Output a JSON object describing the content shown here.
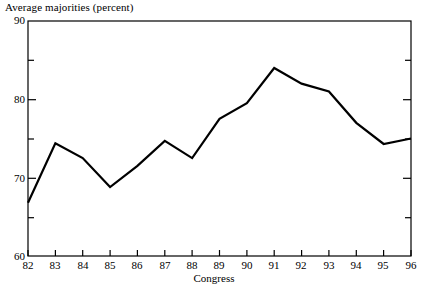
{
  "chart_data": {
    "type": "line",
    "title": "Average majorities (percent)",
    "xlabel": "Congress",
    "ylabel": "",
    "categories": [
      "82",
      "83",
      "84",
      "85",
      "86",
      "87",
      "88",
      "89",
      "90",
      "91",
      "92",
      "93",
      "94",
      "95",
      "96"
    ],
    "values": [
      66.8,
      74.4,
      72.5,
      68.8,
      71.5,
      74.7,
      72.5,
      77.5,
      79.5,
      84.0,
      82.0,
      81.0,
      77.0,
      74.3,
      75.0
    ],
    "series": [
      {
        "name": "Average majorities",
        "values": [
          66.8,
          74.4,
          72.5,
          68.8,
          71.5,
          74.7,
          72.5,
          77.5,
          79.5,
          84.0,
          82.0,
          81.0,
          77.0,
          74.3,
          75.0
        ]
      }
    ],
    "ylim": [
      60,
      90
    ],
    "xlim": [
      "82",
      "96"
    ],
    "y_major_ticks": [
      60,
      70,
      80,
      90
    ],
    "y_minor_ticks": [
      65,
      75,
      85
    ],
    "y_tick_labels": [
      "60",
      "70",
      "80",
      "90"
    ],
    "grid": false,
    "legend": false,
    "line_color": "#000000",
    "axis_color": "#000000",
    "background_color": "#ffffff"
  },
  "axes": {
    "y_labels": [
      "90",
      "80",
      "70",
      "60"
    ],
    "x_labels": [
      "82",
      "83",
      "84",
      "85",
      "86",
      "87",
      "88",
      "89",
      "90",
      "91",
      "92",
      "93",
      "94",
      "95",
      "96"
    ],
    "x_axis_title": "Congress"
  },
  "title": {
    "text": "Average majorities (percent)"
  }
}
